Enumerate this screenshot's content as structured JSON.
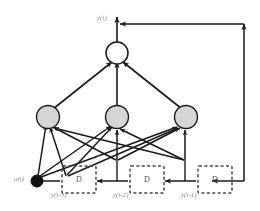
{
  "figure": {
    "type": "neural-network-diagram",
    "name": "NARX recurrent neural network with tapped delay line",
    "background_color": "#ffffff",
    "line_color": "#1a1a1a",
    "label_color": "#777777"
  },
  "output": {
    "label": "y(t)",
    "node_name": "output-neuron",
    "fill_color": "#ffffff",
    "stroke_color": "#1a1a1a"
  },
  "input": {
    "label": "u(t)",
    "node_name": "input-node",
    "fill_color": "#111111",
    "stroke_color": "#111111"
  },
  "hidden_layer": {
    "count": 3,
    "fill_color": "#d5d5d5",
    "stroke_color": "#1a1a1a",
    "nodes": [
      {
        "name": "hidden-neuron-1"
      },
      {
        "name": "hidden-neuron-2"
      },
      {
        "name": "hidden-neuron-3"
      }
    ]
  },
  "delay_line": {
    "box_label": "D",
    "box_border_color": "#444444",
    "boxes": [
      {
        "name": "delay-box-1",
        "label": "D",
        "tap_label": "y(t-3)"
      },
      {
        "name": "delay-box-2",
        "label": "D",
        "tap_label": "y(t-2)"
      },
      {
        "name": "delay-box-3",
        "label": "D",
        "tap_label": "y(t-1)"
      }
    ]
  },
  "feedback": {
    "name": "output-feedback-path",
    "description": "y(t) routed right, down and back into the delay line"
  }
}
